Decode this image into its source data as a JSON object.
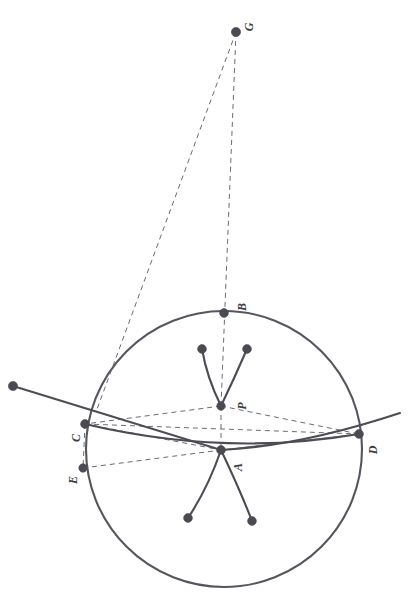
{
  "figure": {
    "kind": "geometry-diagram",
    "width": 413,
    "height": 595,
    "background_color": "#ffffff",
    "orientation_note": "labels rendered rotated 90 degrees counter-clockwise",
    "colors": {
      "stroke": "#55555d",
      "solid_curve": "#4c4c54",
      "dashed_line": "#6b6b73",
      "point_fill": "#4a4a52",
      "label_text": "#3b3b42"
    },
    "styles": {
      "solid_width": 2.1,
      "dashed_width": 1.0,
      "dash_pattern": "5 4",
      "point_radius": 4.2,
      "small_point_radius": 4.0
    }
  },
  "labels": [
    {
      "name": "label-G",
      "text": "G",
      "x": 245,
      "y": 21
    },
    {
      "name": "label-B",
      "text": "B",
      "x": 238,
      "y": 301
    },
    {
      "name": "label-P",
      "text": "P",
      "x": 238,
      "y": 400
    },
    {
      "name": "label-A",
      "text": "A",
      "x": 234,
      "y": 461
    },
    {
      "name": "label-C",
      "text": "C",
      "x": 72,
      "y": 432
    },
    {
      "name": "label-D",
      "text": "D",
      "x": 369,
      "y": 444
    },
    {
      "name": "label-E",
      "text": "E",
      "x": 69,
      "y": 474
    }
  ],
  "points": [
    {
      "name": "point-G",
      "label": "G",
      "x": 236,
      "y": 32,
      "r": 4.6
    },
    {
      "name": "point-B",
      "label": "B",
      "x": 224,
      "y": 313,
      "r": 4.4
    },
    {
      "name": "point-P",
      "label": "P",
      "x": 221,
      "y": 406,
      "r": 4.2
    },
    {
      "name": "point-A",
      "label": "A",
      "x": 221,
      "y": 450,
      "r": 4.4
    },
    {
      "name": "point-C",
      "label": "C",
      "x": 85,
      "y": 424,
      "r": 4.4
    },
    {
      "name": "point-D",
      "label": "D",
      "x": 359,
      "y": 434,
      "r": 4.4
    },
    {
      "name": "point-E",
      "label": "E",
      "x": 83,
      "y": 468,
      "r": 4.2
    },
    {
      "name": "point-arc-left-end",
      "label": "",
      "x": 13,
      "y": 386,
      "r": 4.6
    },
    {
      "name": "point-curve-upper-left-end",
      "label": "",
      "x": 202,
      "y": 349,
      "r": 4.4
    },
    {
      "name": "point-curve-upper-right-end",
      "label": "",
      "x": 247,
      "y": 349,
      "r": 4.4
    },
    {
      "name": "point-curve-lower-left-end",
      "label": "",
      "x": 188,
      "y": 518,
      "r": 4.4
    },
    {
      "name": "point-curve-lower-right-end",
      "label": "",
      "x": 252,
      "y": 521,
      "r": 4.4
    }
  ],
  "circle": {
    "name": "main-circle",
    "cx": 224,
    "cy": 449,
    "r": 138
  },
  "solid_paths": [
    {
      "name": "arc-through-C-D",
      "d": "M 13 386 Q 130 422 221 450 Q 300 446 400 413"
    },
    {
      "name": "chord-arc-C-to-D",
      "d": "M 85 424 Q 225 457 359 434"
    },
    {
      "name": "curve-upper-left-branch",
      "d": "M 202 349 Q 207 378 221 406"
    },
    {
      "name": "curve-upper-right-branch",
      "d": "M 247 349 Q 234 379 221 406"
    },
    {
      "name": "curve-lower-left-branch",
      "d": "M 221 450 Q 208 488 188 518"
    },
    {
      "name": "curve-lower-right-branch",
      "d": "M 221 450 Q 240 490 252 521"
    }
  ],
  "dashed_paths": [
    {
      "name": "dashed-G-to-C",
      "d": "M 236 32 L 96 412"
    },
    {
      "name": "dashed-G-through-B-to-P",
      "d": "M 236 32 L 221 406"
    },
    {
      "name": "dashed-P-to-C",
      "d": "M 221 406 L 85 424"
    },
    {
      "name": "dashed-P-to-D",
      "d": "M 221 406 L 359 434"
    },
    {
      "name": "dashed-C-to-D",
      "d": "M 85 424 L 359 434"
    },
    {
      "name": "dashed-C-to-A",
      "d": "M 85 424 L 221 450"
    },
    {
      "name": "dashed-A-to-D",
      "d": "M 221 450 L 359 434"
    },
    {
      "name": "dashed-E-to-A-to-D",
      "d": "M 83 468 L 221 450 L 359 434"
    },
    {
      "name": "dashed-segment-P-to-A",
      "d": "M 221 406 L 221 450"
    },
    {
      "name": "dashed-arc-C-to-E",
      "d": "M 85 424 L 83 468"
    }
  ]
}
